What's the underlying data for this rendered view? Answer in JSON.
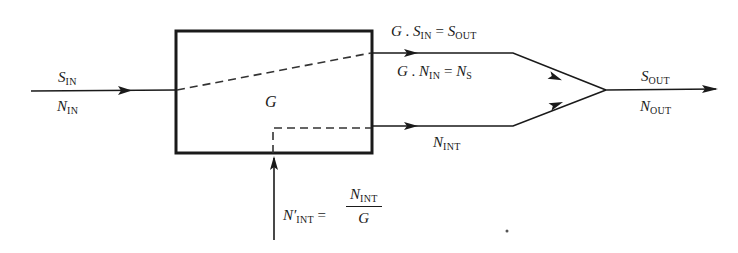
{
  "diagram": {
    "type": "signal-noise block diagram",
    "block": {
      "label": "G"
    },
    "input": {
      "signal": "S",
      "signal_sub": "IN",
      "noise": "N",
      "noise_sub": "IN"
    },
    "top_branch": {
      "line1": {
        "a": "G",
        "dot": ".",
        "b": "S",
        "b_sub": "IN",
        "eq": "=",
        "c": "S",
        "c_sub": "OUT"
      },
      "line2": {
        "a": "G",
        "dot": ".",
        "b": "N",
        "b_sub": "IN",
        "eq": "=",
        "c": "N",
        "c_sub": "S"
      }
    },
    "bottom_branch": {
      "label": "N",
      "label_sub": "INT"
    },
    "output": {
      "signal": "S",
      "signal_sub": "OUT",
      "noise": "N",
      "noise_sub": "OUT"
    },
    "internal_noise": {
      "lhs": "N′",
      "lhs_sub": "INT",
      "eq": "=",
      "num": "N",
      "num_sub": "INT",
      "den": "G"
    },
    "colors": {
      "stroke": "#1a1a1a",
      "background": "#ffffff"
    }
  }
}
